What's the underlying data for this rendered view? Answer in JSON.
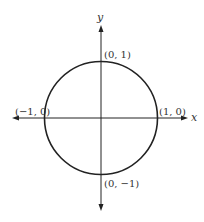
{
  "diagram": {
    "axes": {
      "x_label": "x",
      "y_label": "y"
    },
    "circle": {
      "center": [
        0,
        0
      ],
      "radius": 1
    },
    "points": [
      {
        "label": "(0, 1)",
        "coords": [
          0,
          1
        ]
      },
      {
        "label": "(−1, 0)",
        "coords": [
          -1,
          0
        ]
      },
      {
        "label": "(1, 0)",
        "coords": [
          1,
          0
        ]
      },
      {
        "label": "(0, −1)",
        "coords": [
          0,
          -1
        ]
      }
    ],
    "colors": {
      "stroke": "#222222",
      "text": "#333333",
      "background": "#ffffff"
    }
  }
}
